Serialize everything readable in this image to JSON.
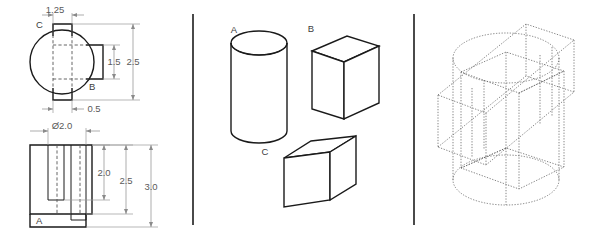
{
  "drawing": {
    "panels": [
      {
        "name": "orthographic-views",
        "views": [
          {
            "name": "top-view",
            "labels": [
              {
                "id": "label-c",
                "text": "C"
              },
              {
                "id": "label-b",
                "text": "B"
              }
            ],
            "dimensions": [
              {
                "id": "dim-1-25",
                "value": "1.25"
              },
              {
                "id": "dim-1-5",
                "value": "1.5"
              },
              {
                "id": "dim-2-5",
                "value": "2.5"
              },
              {
                "id": "dim-0-5",
                "value": "0.5"
              }
            ]
          },
          {
            "name": "front-view",
            "labels": [
              {
                "id": "label-a",
                "text": "A"
              }
            ],
            "dimensions": [
              {
                "id": "dim-dia-2-0",
                "value": "Ø2.0"
              },
              {
                "id": "dim-2-0",
                "value": "2.0"
              },
              {
                "id": "dim-2-5b",
                "value": "2.5"
              },
              {
                "id": "dim-3-0",
                "value": "3.0"
              }
            ]
          }
        ]
      },
      {
        "name": "component-parts",
        "parts": [
          {
            "id": "part-a",
            "label": "A",
            "shape": "cylinder"
          },
          {
            "id": "part-b",
            "label": "B",
            "shape": "rectangular-prism"
          },
          {
            "id": "part-c",
            "label": "C",
            "shape": "flat-slab"
          }
        ]
      },
      {
        "name": "assembly-wireframe",
        "description": "isometric wireframe union of cylinder, prism and slab"
      }
    ],
    "colors": {
      "outline": "#1a1a1a",
      "hidden": "#555555",
      "dimension": "#8a8a8a",
      "wireframe": "#5c5c5c",
      "divider": "#4a4a4a",
      "background": "#ffffff"
    }
  }
}
